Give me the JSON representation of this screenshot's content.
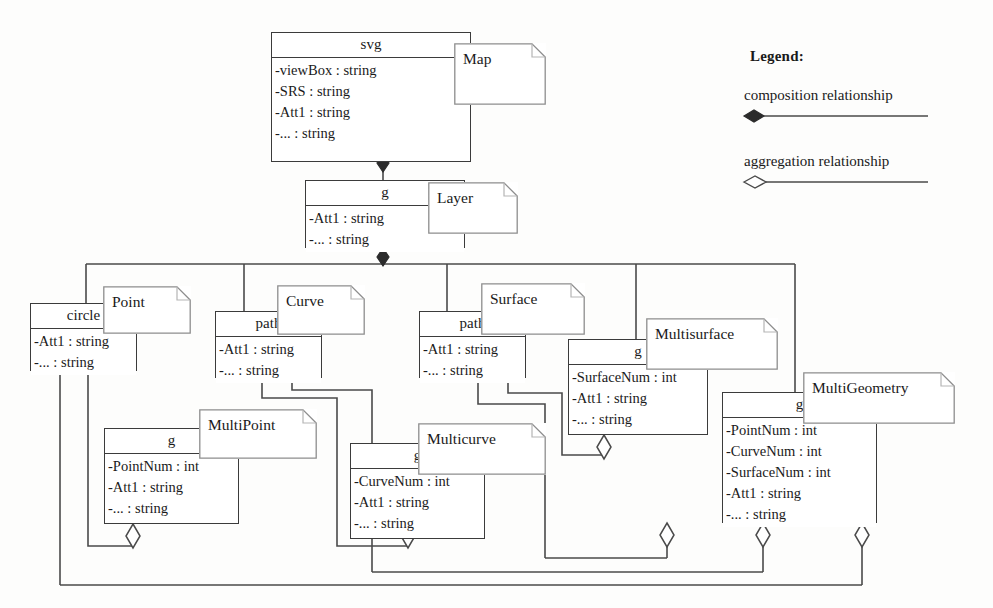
{
  "diagram": {
    "line_color": "#4a4a4a",
    "box_border_color": "#3b3b3b",
    "background": "#fdfdfc"
  },
  "legend": {
    "title": "Legend:",
    "items": [
      {
        "label": "composition relationship",
        "symbol": "filled-diamond"
      },
      {
        "label": "aggregation relationship",
        "symbol": "hollow-diamond"
      }
    ]
  },
  "classes": [
    {
      "id": "svg",
      "title": "svg",
      "note": "Map",
      "attrs": [
        "-viewBox : string",
        "-SRS : string",
        "-Att1 : string",
        "-... : string"
      ]
    },
    {
      "id": "layer",
      "title": "g",
      "note": "Layer",
      "attrs": [
        "-Att1 : string",
        "-... : string"
      ]
    },
    {
      "id": "point",
      "title": "circle",
      "note": "Point",
      "attrs": [
        "-Att1 : string",
        "-... : string"
      ]
    },
    {
      "id": "curve",
      "title": "path",
      "note": "Curve",
      "attrs": [
        "-Att1 : string",
        "-... : string"
      ]
    },
    {
      "id": "surface",
      "title": "path",
      "note": "Surface",
      "attrs": [
        "-Att1 : string",
        "-... : string"
      ]
    },
    {
      "id": "multisurface",
      "title": "g",
      "note": "Multisurface",
      "attrs": [
        "-SurfaceNum : int",
        "-Att1 : string",
        "-... : string"
      ]
    },
    {
      "id": "multigeometry",
      "title": "g",
      "note": "MultiGeometry",
      "attrs": [
        "-PointNum : int",
        "-CurveNum : int",
        "-SurfaceNum : int",
        "-Att1 : string",
        "-... : string"
      ]
    },
    {
      "id": "multipoint",
      "title": "g",
      "note": "MultiPoint",
      "attrs": [
        "-PointNum : int",
        "-Att1 : string",
        "-... : string"
      ]
    },
    {
      "id": "multicurve",
      "title": "g",
      "note": "Multicurve",
      "attrs": [
        "-CurveNum : int",
        "-Att1 : string",
        "-... : string"
      ]
    }
  ],
  "relationships": [
    {
      "from": "svg",
      "to": "layer",
      "type": "composition"
    },
    {
      "from": "layer",
      "to": "point",
      "type": "composition"
    },
    {
      "from": "layer",
      "to": "curve",
      "type": "composition"
    },
    {
      "from": "layer",
      "to": "surface",
      "type": "composition"
    },
    {
      "from": "layer",
      "to": "multigeometry",
      "type": "composition"
    },
    {
      "from": "point",
      "to": "multipoint",
      "type": "aggregation"
    },
    {
      "from": "curve",
      "to": "multicurve",
      "type": "aggregation"
    },
    {
      "from": "surface",
      "to": "multisurface",
      "type": "aggregation"
    },
    {
      "from": "point",
      "to": "multigeometry",
      "type": "aggregation"
    },
    {
      "from": "curve",
      "to": "multigeometry",
      "type": "aggregation"
    },
    {
      "from": "surface",
      "to": "multigeometry",
      "type": "aggregation"
    }
  ]
}
